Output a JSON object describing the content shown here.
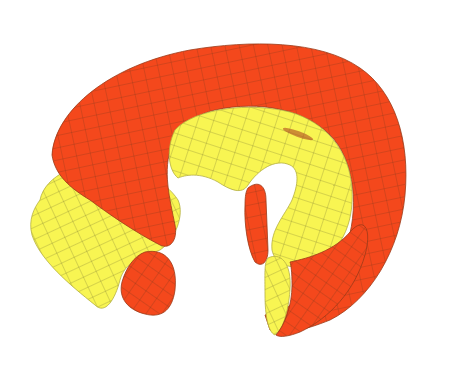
{
  "image": {
    "subject": "cut torus surface rendering",
    "width": 457,
    "height": 368,
    "background": "#ffffff"
  },
  "colors": {
    "outer_surface": "#f4481c",
    "inner_surface": "#f8f552",
    "mesh_line": "#6b4a1c",
    "background": "#ffffff"
  }
}
